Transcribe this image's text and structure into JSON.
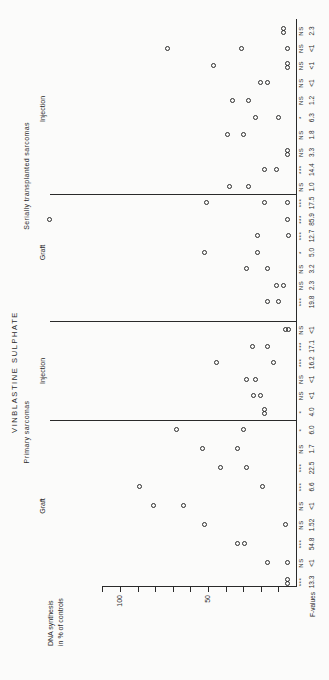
{
  "chart_data": {
    "type": "scatter",
    "title": "VINBLASTINE SULPHATE",
    "orientation": "figure rotated 90 degrees counter-clockwise on page",
    "y_axis": {
      "label_line1": "DNA synthesis",
      "label_line2": "in % of controls",
      "labeled_ticks": [
        100,
        50
      ],
      "minor_tick_step": 10,
      "tick_min": 10,
      "tick_max": 110,
      "baseline_value": 0
    },
    "x_axis": {
      "label": "F-values"
    },
    "significance_values": [
      "NS",
      "*",
      "***"
    ],
    "groups": [
      {
        "name": "Primary sarcomas",
        "subgroups": [
          {
            "name": "Graft",
            "columns": [
              {
                "f": "13.3",
                "sig": "***",
                "points": [
                  5,
                  5
                ]
              },
              {
                "f": "<1",
                "sig": "NS",
                "points": [
                  16,
                  5
                ]
              },
              {
                "f": "54.8",
                "sig": "***",
                "points": [
                  33,
                  29
                ]
              },
              {
                "f": "1.52",
                "sig": "NS",
                "points": [
                  52,
                  6
                ]
              },
              {
                "f": "<1",
                "sig": "NS",
                "points": [
                  81,
                  64
                ]
              },
              {
                "f": "6.6",
                "sig": "***",
                "points": [
                  89,
                  19
                ]
              },
              {
                "f": "22.5",
                "sig": "***",
                "points": [
                  43,
                  28
                ]
              },
              {
                "f": "1.7",
                "sig": "NS",
                "points": [
                  53,
                  33
                ]
              },
              {
                "f": "6.0",
                "sig": "*",
                "points": [
                  68,
                  30
                ]
              }
            ]
          },
          {
            "name": "Injection",
            "columns": [
              {
                "f": "4.0",
                "sig": "*",
                "points": [
                  18,
                  18
                ]
              },
              {
                "f": "<1",
                "sig": "NS",
                "points": [
                  24,
                  20
                ]
              },
              {
                "f": "<1",
                "sig": "NS",
                "points": [
                  28,
                  23
                ]
              },
              {
                "f": "16.2",
                "sig": "***",
                "points": [
                  45,
                  13
                ]
              },
              {
                "f": "17.1",
                "sig": "***",
                "points": [
                  25,
                  16
                ]
              },
              {
                "f": "<1",
                "sig": "NS",
                "points": [
                  6,
                  4
                ]
              }
            ]
          }
        ]
      },
      {
        "name": "Serially transplanted sarcomas",
        "subgroups": [
          {
            "name": "Graft",
            "columns": [
              {
                "f": "19.8",
                "sig": "***",
                "points": [
                  16,
                  10
                ]
              },
              {
                "f": "2.3",
                "sig": "NS",
                "points": [
                  11,
                  7
                ]
              },
              {
                "f": "3.2",
                "sig": "NS",
                "points": [
                  28,
                  16
                ]
              },
              {
                "f": "5.0",
                "sig": "*",
                "points": [
                  52,
                  22
                ]
              },
              {
                "f": "12.7",
                "sig": "***",
                "points": [
                  22,
                  4
                ]
              },
              {
                "f": "85.9",
                "sig": "***",
                "points": [
                  140,
                  5
                ]
              },
              {
                "f": "17.5",
                "sig": "***",
                "points": [
                  51,
                  18,
                  5
                ]
              }
            ]
          },
          {
            "name": "Injection",
            "columns": [
              {
                "f": "1.0",
                "sig": "NS",
                "points": [
                  38,
                  27
                ]
              },
              {
                "f": "14.4",
                "sig": "***",
                "points": [
                  18,
                  11
                ]
              },
              {
                "f": "3.3",
                "sig": "NS",
                "points": [
                  5,
                  5
                ]
              },
              {
                "f": "1.8",
                "sig": "NS",
                "points": [
                  39,
                  30
                ]
              },
              {
                "f": "6.3",
                "sig": "*",
                "points": [
                  23,
                  10
                ]
              },
              {
                "f": "1.2",
                "sig": "NS",
                "points": [
                  36,
                  27
                ]
              },
              {
                "f": "<1",
                "sig": "NS",
                "points": [
                  20,
                  16
                ]
              },
              {
                "f": "<1",
                "sig": "NS",
                "points": [
                  47,
                  5,
                  5
                ]
              },
              {
                "f": "<1",
                "sig": "NS",
                "points": [
                  73,
                  31,
                  5
                ]
              },
              {
                "f": "2.3",
                "sig": "NS",
                "points": [
                  7,
                  7
                ]
              }
            ]
          }
        ]
      }
    ]
  }
}
